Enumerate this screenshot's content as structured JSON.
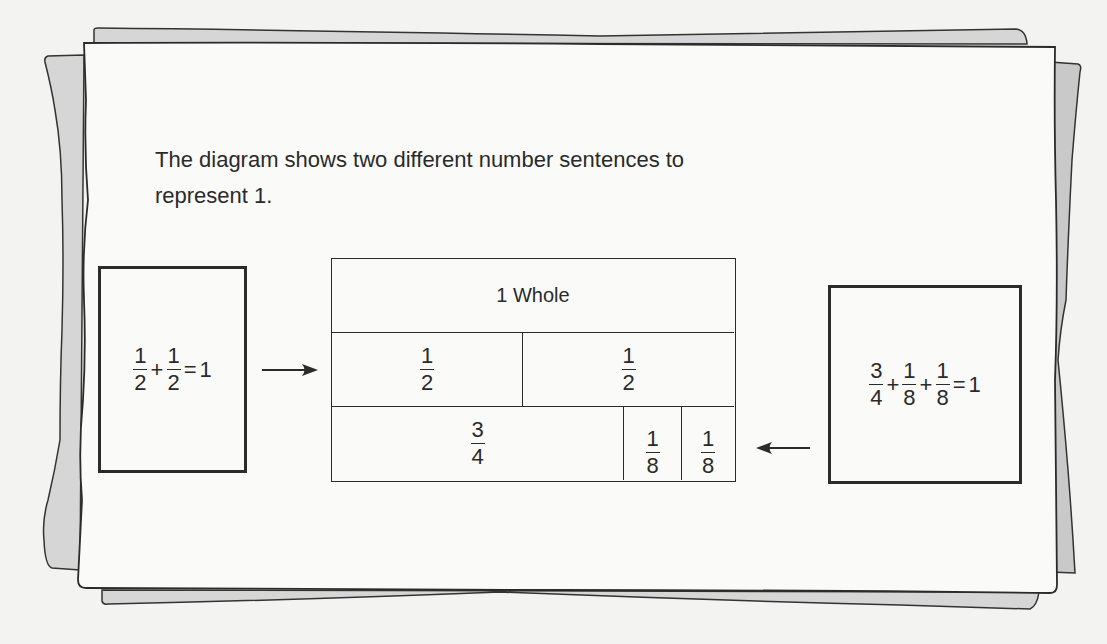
{
  "intro": {
    "line1": "The diagram shows two different number sentences to",
    "line2": "represent 1."
  },
  "left_sentence": {
    "terms": [
      {
        "num": "1",
        "den": "2"
      },
      {
        "op": "+"
      },
      {
        "num": "1",
        "den": "2"
      }
    ],
    "equals": "=",
    "result": "1"
  },
  "right_sentence": {
    "terms": [
      {
        "num": "3",
        "den": "4"
      },
      {
        "op": "+"
      },
      {
        "num": "1",
        "den": "8"
      },
      {
        "op": "+"
      },
      {
        "num": "1",
        "den": "8"
      }
    ],
    "equals": "=",
    "result": "1"
  },
  "fraction_bar": {
    "whole_label": "1 Whole",
    "row_halves": [
      {
        "num": "1",
        "den": "2"
      },
      {
        "num": "1",
        "den": "2"
      }
    ],
    "row_mixed": [
      {
        "num": "3",
        "den": "4"
      },
      {
        "num": "1",
        "den": "8"
      },
      {
        "num": "1",
        "den": "8"
      }
    ]
  },
  "icons": {
    "left_arrow": "arrow-right-icon",
    "right_arrow": "arrow-left-icon"
  },
  "colors": {
    "paper": "#fafaf9",
    "back_paper": "#d6d6d6",
    "ink": "#2b2b2b"
  }
}
